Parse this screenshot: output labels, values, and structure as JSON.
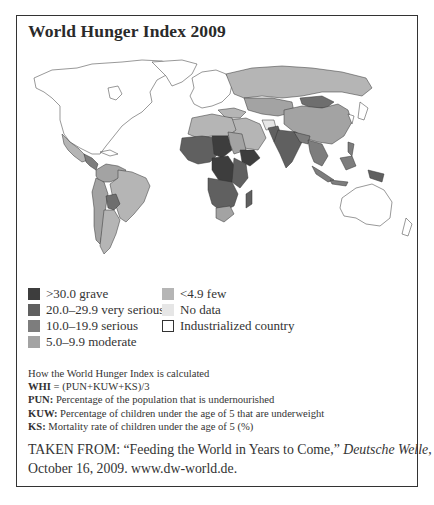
{
  "title": "World Hunger Index 2009",
  "colors": {
    "grave": "#3d3d3d",
    "very_serious": "#606060",
    "serious": "#7d7d7d",
    "moderate": "#a3a3a3",
    "few": "#b5b5b5",
    "no_data": "#e6e6e6",
    "industrialized": "#ffffff"
  },
  "legend": {
    "left": [
      {
        "label": ">30.0 grave",
        "key": "grave"
      },
      {
        "label": "20.0–29.9 very serious",
        "key": "very_serious"
      },
      {
        "label": "10.0–19.9 serious",
        "key": "serious"
      },
      {
        "label": "5.0–9.9 moderate",
        "key": "moderate"
      }
    ],
    "right": [
      {
        "label": "<4.9 few",
        "key": "few"
      },
      {
        "label": "No data",
        "key": "no_data"
      },
      {
        "label": "Industrialized country",
        "key": "industrialized"
      }
    ]
  },
  "calculation": {
    "heading": "How the World Hunger Index is calculated",
    "formula_term": "WHI",
    "formula": " = (PUN+KUW+KS)/3",
    "definitions": [
      {
        "term": "PUN:",
        "text": " Percentage of the population that is undernourished"
      },
      {
        "term": "KUW:",
        "text": " Percentage of children under the age of 5 that are underweight"
      },
      {
        "term": "KS:",
        "text": " Mortality rate of children under the age of 5 (%)"
      }
    ]
  },
  "source": {
    "prefix": "TAKEN FROM: “Feeding the World in Years to Come,” ",
    "publication": "Deutsche Welle",
    "suffix": ",",
    "line2": "October 16, 2009. www.dw-world.de."
  }
}
